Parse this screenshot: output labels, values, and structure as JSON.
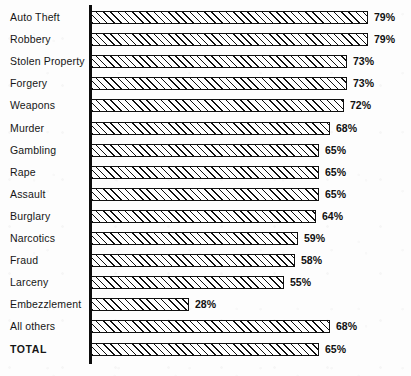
{
  "chart_data": {
    "type": "bar",
    "orientation": "horizontal",
    "title": "",
    "subtitle": "",
    "xlabel": "",
    "ylabel": "",
    "xlim": [
      0,
      100
    ],
    "grid": false,
    "legend": null,
    "value_suffix": "%",
    "categories": [
      "Auto Theft",
      "Robbery",
      "Stolen Property",
      "Forgery",
      "Weapons",
      "Murder",
      "Gambling",
      "Rape",
      "Assault",
      "Burglary",
      "Narcotics",
      "Fraud",
      "Larceny",
      "Embezzlement",
      "All others",
      "TOTAL"
    ],
    "values": [
      79,
      79,
      73,
      73,
      72,
      68,
      65,
      65,
      65,
      64,
      59,
      58,
      55,
      28,
      68,
      65
    ],
    "value_labels": [
      "79%",
      "79%",
      "73%",
      "73%",
      "72%",
      "68%",
      "65%",
      "65%",
      "65%",
      "64%",
      "59%",
      "58%",
      "55%",
      "28%",
      "68%",
      "65%"
    ],
    "emphasized_categories": [
      "TOTAL"
    ]
  },
  "style": {
    "bar_fill": "#ffffff",
    "bar_hatch_color": "#101010",
    "bar_border": "#101010",
    "axis_color": "#0c0c0c",
    "text_color": "#161616",
    "background": "#fdfdfd"
  }
}
